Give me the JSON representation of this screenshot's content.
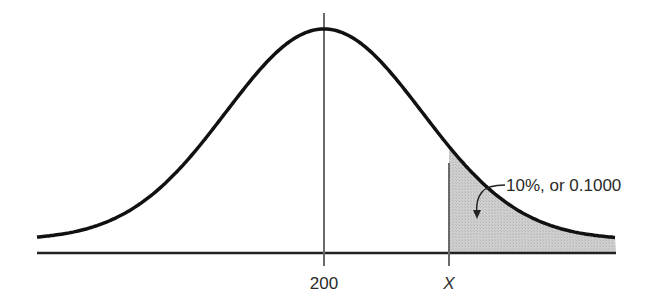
{
  "chart_data": {
    "type": "area",
    "title": "",
    "xlabel": "",
    "ylabel": "",
    "tick_labels": [
      "200",
      "X"
    ],
    "mean": 200,
    "mean_label": "200",
    "cutoff_label": "X",
    "shaded_region": "right tail beyond X",
    "annotation": "10%, or 0.1000",
    "shaded_area": 0.1,
    "grid": false,
    "legend": null
  },
  "colors": {
    "curve": "#111111",
    "axis": "#222222",
    "vline": "#666666",
    "shade": "#c8c8c8"
  }
}
